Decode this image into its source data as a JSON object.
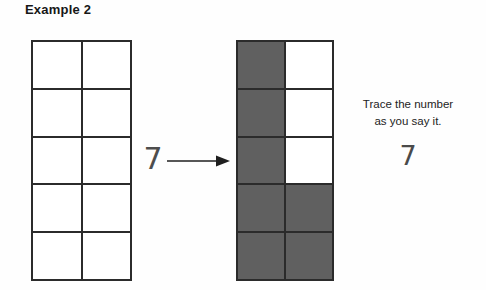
{
  "page": {
    "title": "Example 2",
    "background_color": "#fefefe"
  },
  "colors": {
    "ink": "#2b2b2b",
    "shaded_cell": "#606060",
    "empty_cell": "#ffffff",
    "pencil_numeral": "#4d4d4d"
  },
  "left_grid": {
    "label": "empty ten-frame",
    "columns": 2,
    "rows": 5,
    "total_cells": 10,
    "shaded_count": 0,
    "cells": [
      [
        "empty",
        "empty"
      ],
      [
        "empty",
        "empty"
      ],
      [
        "empty",
        "empty"
      ],
      [
        "empty",
        "empty"
      ],
      [
        "empty",
        "empty"
      ]
    ]
  },
  "middle": {
    "numeral": "7",
    "arrow_icon": "right-arrow-icon"
  },
  "right_grid": {
    "label": "ten-frame shaded to show seven",
    "columns": 2,
    "rows": 5,
    "total_cells": 10,
    "shaded_count": 7,
    "cells": [
      [
        "shaded",
        "empty"
      ],
      [
        "shaded",
        "empty"
      ],
      [
        "shaded",
        "empty"
      ],
      [
        "shaded",
        "shaded"
      ],
      [
        "shaded",
        "shaded"
      ]
    ]
  },
  "instruction": {
    "line1": "Trace the number",
    "line2": "as you say it.",
    "trace_numeral": "7"
  }
}
